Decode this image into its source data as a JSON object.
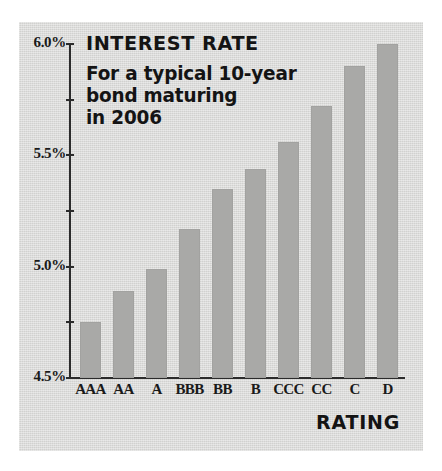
{
  "chart_data": {
    "type": "bar",
    "title": "INTEREST RATE",
    "subtitle_lines": [
      "For a typical 10-year",
      "bond maturing",
      "in 2006"
    ],
    "xlabel": "RATING",
    "ylabel": "",
    "categories": [
      "AAA",
      "AA",
      "A",
      "BBB",
      "BB",
      "B",
      "CCC",
      "CC",
      "C",
      "D"
    ],
    "values": [
      4.75,
      4.89,
      4.99,
      5.17,
      5.35,
      5.44,
      5.56,
      5.72,
      5.9,
      6.0
    ],
    "value_labels": [
      "4.75%",
      "4.89%",
      "4.99%",
      "5.17%",
      "5.35%",
      "5.44%",
      "5.56%",
      "5.72%",
      "5.90%",
      "6.00%"
    ],
    "ylim": [
      4.5,
      6.0
    ],
    "ytick_values": [
      6.0,
      5.75,
      5.5,
      5.25,
      5.0,
      4.75,
      4.5
    ],
    "ytick_labels": [
      "6.0%",
      "",
      "5.5%",
      "",
      "5.0%",
      "",
      "4.5%"
    ],
    "grid": false,
    "legend": null,
    "bar_color": "#a9a9a7",
    "background_color": "#d9d9d7",
    "axis_color": "#2b2b2b",
    "text_color": "#141414"
  }
}
